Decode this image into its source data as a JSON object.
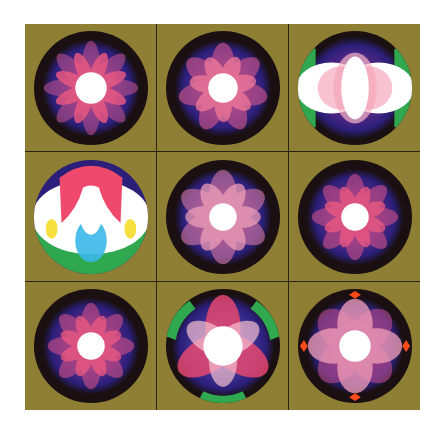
{
  "panel": {
    "background_color": "#8f7f34",
    "grid_line_color": "#2a2410",
    "rows": 3,
    "columns": 3
  },
  "tiles": [
    {
      "name": "tile-1",
      "petals": 8,
      "colors": {
        "outer": "#1a1012",
        "mid": "#2b1f7a",
        "petal": "#e8507a",
        "center": "#ffffff"
      }
    },
    {
      "name": "tile-2",
      "petals": 7,
      "colors": {
        "outer": "#1a1012",
        "mid": "#2b1f7a",
        "petal": "#e8507a",
        "center": "#ffffff"
      }
    },
    {
      "name": "tile-3",
      "petals": 4,
      "accents": [
        "#2fa84f",
        "#f5e87a"
      ],
      "colors": {
        "outer": "#1a1012",
        "mid": "#2b1f7a",
        "petal": "#f09ab0",
        "center": "#ffffff"
      }
    },
    {
      "name": "tile-4",
      "accents": [
        "#2fa84f",
        "#3ab8e8",
        "#f5e040"
      ],
      "colors": {
        "outer": "#2b1f7a",
        "mid": "#ffffff",
        "petal": "#ef4a6e",
        "center": "#ffffff"
      }
    },
    {
      "name": "tile-5",
      "petals": 6,
      "colors": {
        "outer": "#1a1012",
        "mid": "#2b1f7a",
        "petal": "#f09ab0",
        "center": "#ffffff"
      }
    },
    {
      "name": "tile-6",
      "petals": 8,
      "colors": {
        "outer": "#1a1012",
        "mid": "#2b1f7a",
        "petal": "#e8507a",
        "center": "#ffffff"
      }
    },
    {
      "name": "tile-7",
      "petals": 8,
      "colors": {
        "outer": "#1a1012",
        "mid": "#2b1f7a",
        "petal": "#e8507a",
        "center": "#ffffff"
      }
    },
    {
      "name": "tile-8",
      "petals": 3,
      "accents": [
        "#2fa84f"
      ],
      "colors": {
        "outer": "#1a1012",
        "mid": "#2b1f7a",
        "petal": "#ef4a6e",
        "center": "#ffffff"
      }
    },
    {
      "name": "tile-9",
      "petals": 4,
      "accents": [
        "#ff4a1a"
      ],
      "colors": {
        "outer": "#1a1012",
        "mid": "#2b1f7a",
        "petal": "#f09ab0",
        "center": "#ffffff"
      }
    }
  ]
}
